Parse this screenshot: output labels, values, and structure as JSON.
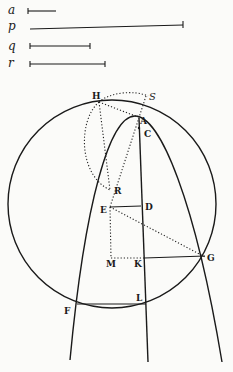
{
  "segments": [
    {
      "label": "a",
      "x1": 28,
      "x2": 56,
      "y": 11
    },
    {
      "label": "p",
      "x1": 30,
      "x2": 183,
      "y": 27
    },
    {
      "label": "q",
      "x1": 30,
      "x2": 90,
      "y": 46
    },
    {
      "label": "r",
      "x1": 30,
      "x2": 105,
      "y": 64
    }
  ],
  "points": {
    "H": "H",
    "S": "S",
    "A": "A",
    "C": "C",
    "R": "R",
    "E": "E",
    "D": "D",
    "M": "M",
    "K": "K",
    "G": "G",
    "F": "F",
    "L": "L"
  }
}
